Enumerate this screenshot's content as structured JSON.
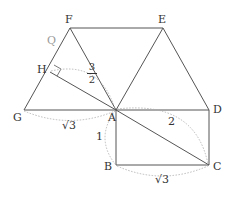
{
  "diagram": {
    "points": {
      "F": {
        "label": "F",
        "x": 70,
        "y": 28
      },
      "E": {
        "label": "E",
        "x": 163,
        "y": 28
      },
      "A": {
        "label": "A",
        "x": 116,
        "y": 110
      },
      "G": {
        "label": "G",
        "x": 24,
        "y": 110
      },
      "D": {
        "label": "D",
        "x": 209,
        "y": 110
      },
      "C": {
        "label": "C",
        "x": 209,
        "y": 165
      },
      "B": {
        "label": "B",
        "x": 116,
        "y": 165
      },
      "H": {
        "label": "H",
        "x": 50,
        "y": 72
      }
    },
    "extra_label": "Q",
    "measures": {
      "AH_num": "3",
      "AH_den": "2",
      "GA": "√3",
      "AB": "1",
      "AC": "2",
      "BC": "√3"
    },
    "colors": {
      "line": "#555555",
      "dotted": "#aaaaaa",
      "text": "#333333"
    }
  }
}
